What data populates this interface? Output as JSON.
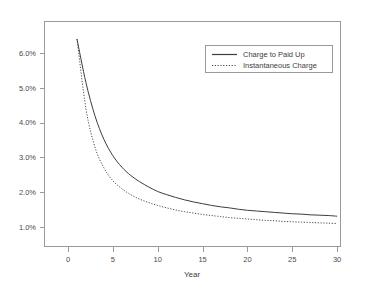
{
  "chart_data": {
    "type": "line",
    "title": "",
    "xlabel": "Year",
    "ylabel": "",
    "xlim": [
      0,
      30
    ],
    "ylim": [
      0.01,
      0.065
    ],
    "grid": false,
    "legend_position": "top-right",
    "x_tick_labels": [
      "0",
      "5",
      "10",
      "15",
      "20",
      "25",
      "30"
    ],
    "x_ticks": [
      0,
      5,
      10,
      15,
      20,
      25,
      30
    ],
    "y_tick_labels": [
      "1.0%",
      "2.0%",
      "3.0%",
      "4.0%",
      "5.0%",
      "6.0%"
    ],
    "y_ticks": [
      1.0,
      2.0,
      3.0,
      4.0,
      5.0,
      6.0
    ],
    "x": [
      1,
      2,
      3,
      4,
      5,
      6,
      7,
      8,
      9,
      10,
      11,
      12,
      13,
      14,
      15,
      16,
      17,
      18,
      19,
      20,
      21,
      22,
      23,
      24,
      25,
      26,
      27,
      28,
      29,
      30
    ],
    "series": [
      {
        "name": "Charge to Paid Up",
        "style": "solid",
        "color": "#3c3c3c",
        "values": [
          6.4,
          5.15,
          4.2,
          3.52,
          3.05,
          2.72,
          2.48,
          2.3,
          2.15,
          2.02,
          1.93,
          1.85,
          1.78,
          1.72,
          1.67,
          1.62,
          1.58,
          1.55,
          1.51,
          1.48,
          1.46,
          1.44,
          1.42,
          1.4,
          1.38,
          1.37,
          1.35,
          1.34,
          1.33,
          1.31
        ]
      },
      {
        "name": "Instantaneous Charge",
        "style": "dotted",
        "color": "#4a4a4a",
        "values": [
          6.4,
          4.4,
          3.3,
          2.7,
          2.33,
          2.1,
          1.93,
          1.8,
          1.7,
          1.62,
          1.55,
          1.49,
          1.44,
          1.4,
          1.36,
          1.33,
          1.3,
          1.27,
          1.25,
          1.23,
          1.21,
          1.19,
          1.18,
          1.16,
          1.15,
          1.14,
          1.13,
          1.12,
          1.11,
          1.1
        ]
      }
    ]
  },
  "legend": {
    "entries": [
      {
        "label": "Charge to Paid Up"
      },
      {
        "label": "Instantaneous Charge"
      }
    ]
  },
  "axes": {
    "x_title": "Year"
  },
  "colors": {
    "frame": "#9a9a9a",
    "text": "#3d3d3d",
    "series_solid": "#3c3c3c",
    "series_dotted": "#4a4a4a",
    "background": "#ffffff"
  }
}
